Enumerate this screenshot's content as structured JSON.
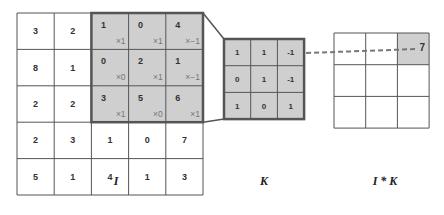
{
  "colors": {
    "highlight_fill": "#cfcfcf",
    "grid_line": "#555555",
    "thick_border": "#555555",
    "text": "#333333",
    "background": "#ffffff"
  },
  "input_matrix": {
    "label": "I",
    "rows": [
      [
        "3",
        "2",
        "1",
        "0",
        "4"
      ],
      [
        "8",
        "1",
        "0",
        "2",
        "1"
      ],
      [
        "2",
        "2",
        "3",
        "5",
        "6"
      ],
      [
        "2",
        "3",
        "1",
        "0",
        "7"
      ],
      [
        "5",
        "1",
        "4",
        "1",
        "3"
      ]
    ],
    "highlight": {
      "row_start": 0,
      "col_start": 2,
      "size": 3
    },
    "multipliers": [
      [
        "×1",
        "×1",
        "×−1"
      ],
      [
        "×0",
        "×1",
        "×−1"
      ],
      [
        "×1",
        "×0",
        "×1"
      ]
    ]
  },
  "kernel": {
    "label": "K",
    "rows": [
      [
        "1",
        "1",
        "-1"
      ],
      [
        "0",
        "1",
        "-1"
      ],
      [
        "1",
        "0",
        "1"
      ]
    ]
  },
  "output_matrix": {
    "label": "I * K",
    "rows": [
      [
        "",
        "",
        "7"
      ],
      [
        "",
        "",
        ""
      ],
      [
        "",
        "",
        ""
      ]
    ],
    "highlight": {
      "row": 0,
      "col": 2
    }
  }
}
